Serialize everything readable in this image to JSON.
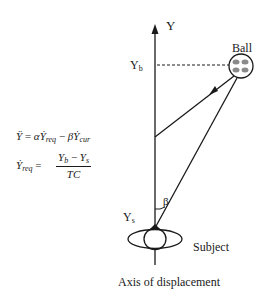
{
  "diagram": {
    "axis_label": "Y",
    "ball_label": "Ball",
    "ball_position_label": "Y",
    "ball_position_subscript": "b",
    "subject_position_label": "Y",
    "subject_position_subscript": "s",
    "angle_label": "β",
    "subject_label": "Subject",
    "caption": "Axis of displacement"
  },
  "equations": {
    "eq1": {
      "lhs": "Ÿ",
      "equals": "=",
      "alpha": "α",
      "ydot1": "Ẏ",
      "sub1": "req",
      "minus": "−",
      "beta": "β",
      "ydot2": "Ẏ",
      "sub2": "cur"
    },
    "eq2": {
      "lhs": "Ẏ",
      "lhs_sub": "req",
      "equals": "=",
      "numerator": "Yb − Ys",
      "num_y1": "Y",
      "num_sub1": "b",
      "num_minus": " − ",
      "num_y2": "Y",
      "num_sub2": "s",
      "denominator": "TC"
    }
  },
  "colors": {
    "ink": "#1a1a1a",
    "ball_fill": "#8a8a8a",
    "background": "#ffffff"
  }
}
